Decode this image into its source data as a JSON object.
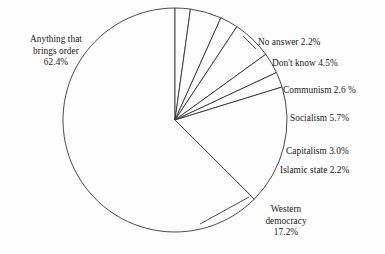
{
  "chart_data": {
    "type": "pie",
    "title": "",
    "subtitle": "",
    "xlabel": "",
    "ylabel": "",
    "legend_position": "none",
    "grid": false,
    "labels_show_percent": true,
    "start_angle_deg": 0,
    "direction": "counterclockwise-for-major",
    "categories": [
      "Anything that brings order",
      "No answer",
      "Don't know",
      "Communism",
      "Socialism",
      "Capitalism",
      "Islamic state",
      "Western democracy"
    ],
    "values": [
      62.4,
      2.2,
      4.5,
      2.6,
      5.7,
      3.0,
      2.2,
      17.2
    ],
    "units": "percent",
    "slices": [
      {
        "name": "Anything that brings order",
        "value": 62.4,
        "value_text": "62.4%",
        "label_lines": [
          "Anything that",
          "brings order",
          "62.4%"
        ],
        "label_position": "left-outside"
      },
      {
        "name": "No answer",
        "value": 2.2,
        "value_text": "2.2%",
        "label_lines": [
          "No answer 2.2%"
        ],
        "label_position": "right-outside"
      },
      {
        "name": "Don't know",
        "value": 4.5,
        "value_text": "4.5%",
        "label_lines": [
          "Don't know 4.5%"
        ],
        "label_position": "right-outside"
      },
      {
        "name": "Communism",
        "value": 2.6,
        "value_text": "2.6 %",
        "label_lines": [
          "Communism 2.6 %"
        ],
        "label_position": "right-outside"
      },
      {
        "name": "Socialism",
        "value": 5.7,
        "value_text": "5.7%",
        "label_lines": [
          "Socialism 5.7%"
        ],
        "label_position": "right-outside"
      },
      {
        "name": "Capitalism",
        "value": 3.0,
        "value_text": "3.0%",
        "label_lines": [
          "Capitalism 3.0%"
        ],
        "label_position": "right-outside"
      },
      {
        "name": "Islamic state",
        "value": 2.2,
        "value_text": "2.2%",
        "label_lines": [
          "Islamic state 2.2%"
        ],
        "label_position": "right-outside"
      },
      {
        "name": "Western democracy",
        "value": 17.2,
        "value_text": "17.2%",
        "label_lines": [
          "Western",
          "democracy",
          "17.2%"
        ],
        "label_position": "bottom-right-outside"
      }
    ],
    "colors": {
      "slice_fill": "#fdfdfd",
      "slice_stroke": "#2b2b2b",
      "background": "#fdfdfd",
      "text": "#1a1a1a"
    }
  },
  "labels": {
    "anything_line1": "Anything that",
    "anything_line2": "brings order",
    "anything_line3": "62.4%",
    "no_answer": "No answer 2.2%",
    "dont_know": "Don't know 4.5%",
    "communism": "Communism 2.6 %",
    "socialism": "Socialism 5.7%",
    "capitalism": "Capitalism 3.0%",
    "islamic_state": "Islamic state 2.2%",
    "western_line1": "Western",
    "western_line2": "democracy",
    "western_line3": "17.2%"
  }
}
